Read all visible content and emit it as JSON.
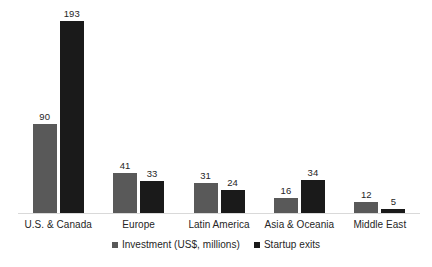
{
  "chart_data": {
    "type": "bar",
    "title": "",
    "subtitle": "",
    "xlabel": "",
    "ylabel": "",
    "grid": false,
    "y_axis_visible": false,
    "data_labels": true,
    "legend_position": "bottom",
    "ylim": [
      0,
      193
    ],
    "categories": [
      "U.S. & Canada",
      "Europe",
      "Latin America",
      "Asia & Oceania",
      "Middle East"
    ],
    "series": [
      {
        "name": "Investment (US$, millions)",
        "color": "#595959",
        "values": [
          90,
          41,
          31,
          16,
          12
        ]
      },
      {
        "name": "Startup exits",
        "color": "#1a1a1a",
        "values": [
          193,
          33,
          24,
          34,
          5
        ]
      }
    ]
  },
  "colors": {
    "investment": "#595959",
    "startup_exits": "#1a1a1a",
    "axis": "#d9d9d9",
    "text": "#262626",
    "background": "#ffffff"
  }
}
